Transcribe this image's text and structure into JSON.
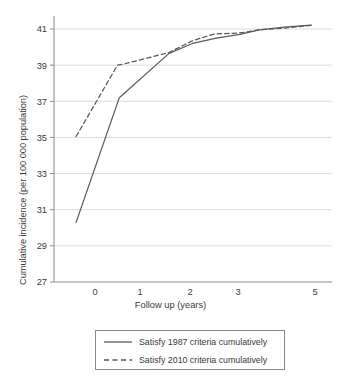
{
  "chart_data": {
    "type": "line",
    "title": "",
    "xlabel": "Follow up (years)",
    "ylabel": "Cumulative incidence (per 100 000 population)",
    "xlim": [
      -0.55,
      5.3
    ],
    "ylim": [
      27,
      41.8
    ],
    "xticks": [
      0,
      1,
      2,
      3,
      5
    ],
    "xticklabels": [
      "0",
      "1",
      "2",
      "3",
      "5"
    ],
    "yticks": [
      27,
      29,
      31,
      33,
      35,
      37,
      39,
      41
    ],
    "yticklabels": [
      "27",
      "29",
      "31",
      "33",
      "35",
      "37",
      "39",
      "41"
    ],
    "grid": "horizontal",
    "legend_position": "below-center",
    "series": [
      {
        "name": "Satisfy 1987 criteria cumulatively",
        "style": "solid",
        "color": "#5a5a5a",
        "points": [
          [
            -0.42,
            30.3
          ],
          [
            0.54,
            37.2
          ],
          [
            1.58,
            39.65
          ],
          [
            2.05,
            40.2
          ],
          [
            2.55,
            40.5
          ],
          [
            3.05,
            40.7
          ],
          [
            3.55,
            40.95
          ],
          [
            4.2,
            41.1
          ],
          [
            4.9,
            41.22
          ]
        ]
      },
      {
        "name": "Satisfy 2010 criteria cumulatively",
        "style": "dashed",
        "color": "#5a5a5a",
        "points": [
          [
            -0.42,
            35.05
          ],
          [
            0.5,
            39.0
          ],
          [
            0.62,
            39.05
          ],
          [
            1.58,
            39.7
          ],
          [
            2.05,
            40.35
          ],
          [
            2.5,
            40.72
          ],
          [
            3.05,
            40.78
          ],
          [
            3.55,
            40.95
          ],
          [
            4.2,
            41.05
          ],
          [
            4.9,
            41.2
          ]
        ]
      }
    ]
  },
  "axis": {
    "y_title": "Cumulative incidence (per 100 000 population)",
    "x_title": "Follow up (years)"
  },
  "legend": {
    "items": [
      {
        "label": "Satisfy 1987 criteria cumulatively",
        "style": "solid"
      },
      {
        "label": "Satisfy 2010 criteria cumulatively",
        "style": "dashed"
      }
    ]
  },
  "colors": {
    "line": "#5a5a5a",
    "grid": "#d8d8d8",
    "axis": "#8a8a8a",
    "text": "#3a3a3a",
    "background": "#ffffff"
  }
}
